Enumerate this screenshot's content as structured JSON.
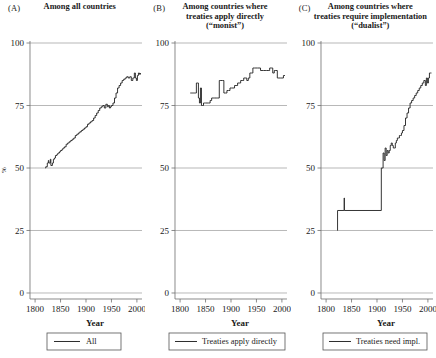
{
  "figure": {
    "width": 436,
    "height": 358,
    "background": "#ffffff",
    "line_color": "#2b2b2b",
    "grid_color": "#9a9a9a"
  },
  "panels": [
    {
      "letter": "(A)",
      "title_lines": [
        "Among all countries"
      ],
      "legend_label": "All"
    },
    {
      "letter": "(B)",
      "title_lines": [
        "Among countries where",
        "treaties apply directly",
        "(“monist”)"
      ],
      "legend_label": "Treaties apply directly"
    },
    {
      "letter": "(C)",
      "title_lines": [
        "Among countries where",
        "treaties require implementation",
        "(“dualist”)"
      ],
      "legend_label": "Treaties need impl."
    }
  ],
  "axes": {
    "xlabel": "Year",
    "ylabel": "%",
    "xticks": [
      1800,
      1850,
      1900,
      1950,
      2000
    ],
    "xticklabels": [
      "1800",
      "1850",
      "1900",
      "1950",
      "2000"
    ],
    "yticks": [
      0,
      25,
      50,
      75,
      100
    ],
    "yticklabels": [
      "0",
      "25",
      "50",
      "75",
      "100"
    ],
    "xlim": [
      1790,
      2010
    ],
    "ylim": [
      0,
      100
    ],
    "grid": "horizontal"
  },
  "chart_data": {
    "type": "line",
    "xlabel": "Year",
    "ylabel": "%",
    "xlim": [
      1790,
      2010
    ],
    "ylim": [
      0,
      100
    ],
    "grid": true,
    "legend_position": "below-panel",
    "panels": [
      {
        "id": "A",
        "title": "Among all countries",
        "legend": "All",
        "series": [
          {
            "name": "All",
            "x": [
              1820,
              1821,
              1824,
              1826,
              1827,
              1830,
              1831,
              1834,
              1836,
              1838,
              1840,
              1843,
              1845,
              1848,
              1850,
              1853,
              1855,
              1858,
              1861,
              1864,
              1867,
              1870,
              1873,
              1876,
              1879,
              1882,
              1885,
              1888,
              1891,
              1894,
              1897,
              1900,
              1903,
              1906,
              1909,
              1912,
              1915,
              1918,
              1921,
              1924,
              1927,
              1930,
              1933,
              1936,
              1939,
              1942,
              1944,
              1946,
              1948,
              1950,
              1953,
              1956,
              1959,
              1962,
              1965,
              1968,
              1971,
              1974,
              1977,
              1980,
              1983,
              1986,
              1989,
              1992,
              1995,
              1997,
              1999,
              2001,
              2003,
              2005,
              2007
            ],
            "y": [
              50,
              50.5,
              52,
              53,
              52,
              53.5,
              51,
              52,
              53.5,
              54,
              55,
              55.5,
              56,
              56.5,
              57,
              57.5,
              58,
              58.5,
              59.5,
              60,
              60.5,
              61,
              61.5,
              62,
              63,
              63.5,
              64,
              64.5,
              65,
              65.5,
              66,
              66.5,
              67.5,
              68,
              68.5,
              69,
              70,
              71,
              72,
              73,
              74,
              74.5,
              75,
              74,
              75.5,
              74.5,
              75,
              74,
              74.5,
              75,
              76,
              78,
              80,
              82,
              83,
              84,
              85,
              85.5,
              86,
              86.5,
              86,
              86.5,
              85,
              86,
              88,
              86,
              85,
              87,
              88,
              87.5,
              88
            ]
          }
        ]
      },
      {
        "id": "B",
        "title": "Among countries where treaties apply directly (“monist”)",
        "legend": "Treaties apply directly",
        "series": [
          {
            "name": "Treaties apply directly",
            "x": [
              1820,
              1822,
              1824,
              1826,
              1828,
              1830,
              1832,
              1834,
              1836,
              1838,
              1840,
              1842,
              1844,
              1846,
              1848,
              1850,
              1853,
              1856,
              1859,
              1862,
              1865,
              1868,
              1871,
              1874,
              1877,
              1880,
              1883,
              1886,
              1889,
              1892,
              1895,
              1898,
              1901,
              1904,
              1907,
              1910,
              1913,
              1916,
              1919,
              1922,
              1925,
              1928,
              1931,
              1934,
              1937,
              1940,
              1943,
              1946,
              1949,
              1952,
              1955,
              1958,
              1961,
              1964,
              1967,
              1970,
              1973,
              1976,
              1979,
              1982,
              1985,
              1988,
              1991,
              1994,
              1997,
              2000,
              2003,
              2006
            ],
            "y": [
              80,
              80,
              80,
              80,
              80,
              80,
              84,
              84,
              78,
              76,
              82,
              75,
              75,
              76,
              76,
              76,
              76,
              76,
              77,
              78,
              78,
              78,
              78,
              78,
              85,
              85,
              85,
              80,
              80,
              81,
              81,
              82,
              82,
              82,
              83,
              83,
              84,
              84,
              85,
              85,
              86,
              86,
              85,
              86,
              88,
              88,
              90,
              90,
              90,
              90,
              90,
              89,
              89,
              89,
              89,
              89,
              89,
              90,
              90,
              88,
              89,
              89,
              86,
              86,
              86,
              86,
              87,
              87
            ]
          }
        ]
      },
      {
        "id": "C",
        "title": "Among countries where treaties require implementation (“dualist”)",
        "legend": "Treaties need impl.",
        "series": [
          {
            "name": "Treaties need impl.",
            "x": [
              1822,
              1822.5,
              1835,
              1835.5,
              1836,
              1908,
              1908.5,
              1910,
              1912,
              1914,
              1916,
              1918,
              1920,
              1922,
              1924,
              1926,
              1928,
              1930,
              1932,
              1934,
              1936,
              1938,
              1940,
              1942,
              1944,
              1946,
              1948,
              1950,
              1953,
              1956,
              1959,
              1962,
              1965,
              1968,
              1971,
              1974,
              1977,
              1980,
              1983,
              1986,
              1989,
              1992,
              1995,
              1997,
              1999,
              2001,
              2003,
              2005,
              2007
            ],
            "y": [
              25,
              33,
              33,
              38,
              33,
              33,
              50,
              50,
              56,
              53,
              58,
              55,
              57,
              56,
              57,
              59,
              60,
              59,
              58,
              58,
              60,
              61,
              62,
              62,
              63,
              63,
              64,
              65,
              67,
              70,
              72,
              74,
              76,
              77,
              78,
              79,
              80,
              81,
              82,
              83,
              84,
              85,
              83,
              86,
              84,
              86,
              88,
              88,
              88
            ]
          }
        ]
      }
    ]
  }
}
